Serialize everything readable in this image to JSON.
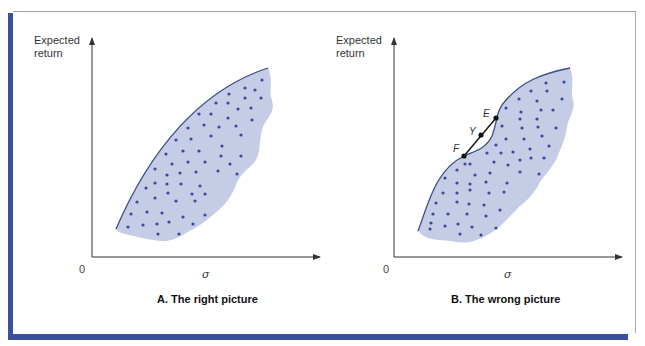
{
  "figure": {
    "colors": {
      "frame_accent": "#3c4ea0",
      "region_fill": "#c5cde6",
      "frontier_line": "#3a4a8a",
      "dots": "#3a4a9a",
      "axes": "#333333"
    },
    "panels": [
      {
        "id": "A",
        "ylabel_line1": "Expected",
        "ylabel_line2": "return",
        "origin_label": "0",
        "xlabel": "σ",
        "caption": "A.  The right picture"
      },
      {
        "id": "B",
        "ylabel_line1": "Expected",
        "ylabel_line2": "return",
        "origin_label": "0",
        "xlabel": "σ",
        "caption": "B.  The wrong picture",
        "points": [
          {
            "label": "E"
          },
          {
            "label": "Y"
          },
          {
            "label": "F"
          }
        ]
      }
    ]
  }
}
